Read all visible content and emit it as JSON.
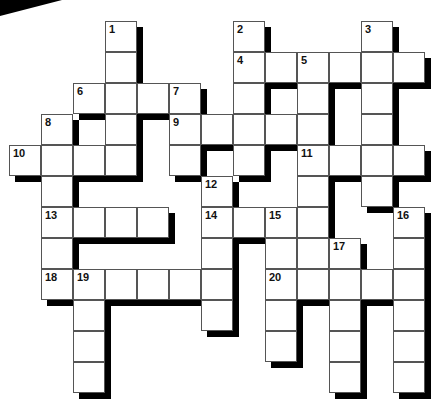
{
  "puzzle": {
    "type": "crossword",
    "grid": {
      "origin": [
        9,
        21
      ],
      "cell_w": 32,
      "cell_h": 31,
      "cols": 13,
      "rows": 12,
      "cells": [
        [
          0,
          3,
          "1"
        ],
        [
          0,
          7,
          "2"
        ],
        [
          0,
          11,
          "3"
        ],
        [
          1,
          3,
          ""
        ],
        [
          1,
          7,
          "4"
        ],
        [
          1,
          8,
          ""
        ],
        [
          1,
          9,
          "5"
        ],
        [
          1,
          10,
          ""
        ],
        [
          1,
          11,
          ""
        ],
        [
          1,
          12,
          ""
        ],
        [
          2,
          2,
          "6"
        ],
        [
          2,
          3,
          ""
        ],
        [
          2,
          4,
          ""
        ],
        [
          2,
          5,
          "7"
        ],
        [
          2,
          7,
          ""
        ],
        [
          2,
          9,
          ""
        ],
        [
          2,
          11,
          ""
        ],
        [
          3,
          1,
          "8"
        ],
        [
          3,
          3,
          ""
        ],
        [
          3,
          5,
          "9"
        ],
        [
          3,
          6,
          ""
        ],
        [
          3,
          7,
          ""
        ],
        [
          3,
          8,
          ""
        ],
        [
          3,
          9,
          ""
        ],
        [
          3,
          11,
          ""
        ],
        [
          4,
          0,
          "10"
        ],
        [
          4,
          1,
          ""
        ],
        [
          4,
          2,
          ""
        ],
        [
          4,
          3,
          ""
        ],
        [
          4,
          5,
          ""
        ],
        [
          4,
          7,
          ""
        ],
        [
          4,
          9,
          "11"
        ],
        [
          4,
          10,
          ""
        ],
        [
          4,
          11,
          ""
        ],
        [
          4,
          12,
          ""
        ],
        [
          5,
          1,
          ""
        ],
        [
          5,
          6,
          "12"
        ],
        [
          5,
          9,
          ""
        ],
        [
          5,
          11,
          ""
        ],
        [
          6,
          1,
          "13"
        ],
        [
          6,
          2,
          ""
        ],
        [
          6,
          3,
          ""
        ],
        [
          6,
          4,
          ""
        ],
        [
          6,
          6,
          "14"
        ],
        [
          6,
          7,
          ""
        ],
        [
          6,
          8,
          "15"
        ],
        [
          6,
          9,
          ""
        ],
        [
          6,
          12,
          "16"
        ],
        [
          7,
          1,
          ""
        ],
        [
          7,
          6,
          ""
        ],
        [
          7,
          8,
          ""
        ],
        [
          7,
          9,
          ""
        ],
        [
          7,
          10,
          "17"
        ],
        [
          7,
          12,
          ""
        ],
        [
          8,
          1,
          "18"
        ],
        [
          8,
          2,
          "19"
        ],
        [
          8,
          3,
          ""
        ],
        [
          8,
          4,
          ""
        ],
        [
          8,
          5,
          ""
        ],
        [
          8,
          6,
          ""
        ],
        [
          8,
          8,
          "20"
        ],
        [
          8,
          9,
          ""
        ],
        [
          8,
          10,
          ""
        ],
        [
          8,
          11,
          ""
        ],
        [
          8,
          12,
          ""
        ],
        [
          9,
          2,
          ""
        ],
        [
          9,
          6,
          ""
        ],
        [
          9,
          8,
          ""
        ],
        [
          9,
          10,
          ""
        ],
        [
          9,
          12,
          ""
        ],
        [
          10,
          2,
          ""
        ],
        [
          10,
          8,
          ""
        ],
        [
          10,
          10,
          ""
        ],
        [
          10,
          12,
          ""
        ],
        [
          11,
          2,
          ""
        ],
        [
          11,
          10,
          ""
        ],
        [
          11,
          12,
          ""
        ]
      ]
    },
    "clue_numbers": [
      "1",
      "2",
      "3",
      "4",
      "5",
      "6",
      "7",
      "8",
      "9",
      "10",
      "11",
      "12",
      "13",
      "14",
      "15",
      "16",
      "17",
      "18",
      "19",
      "20"
    ],
    "colors": {
      "cell_fill": "#ffffff",
      "cell_border": "#555555",
      "shadow": "#000000",
      "number": "#111111"
    }
  }
}
